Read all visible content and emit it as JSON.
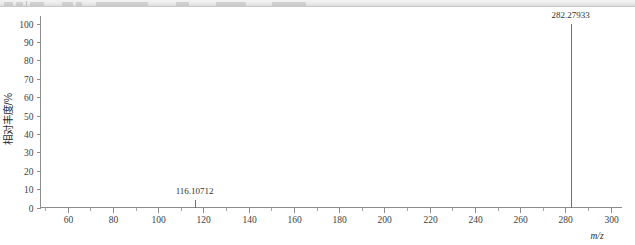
{
  "toolbar": {
    "visible_sliver": true,
    "ghost_labels": [
      "",
      "",
      "",
      "",
      "",
      "",
      ""
    ]
  },
  "chart_data": {
    "type": "bar",
    "title": "",
    "subtitle": "",
    "xlabel": "m/z",
    "ylabel": "相对丰度/%",
    "xlim": [
      48,
      305
    ],
    "ylim": [
      0,
      100
    ],
    "grid": false,
    "legend": null,
    "x_ticks": [
      60,
      80,
      100,
      120,
      140,
      160,
      180,
      200,
      220,
      240,
      260,
      280,
      300
    ],
    "x_tick_labels": [
      "60",
      "80",
      "100",
      "120",
      "140",
      "160",
      "180",
      "200",
      "220",
      "240",
      "260",
      "280",
      "300"
    ],
    "x_minor_tick_step": 10,
    "y_ticks": [
      0,
      10,
      20,
      30,
      40,
      50,
      60,
      70,
      80,
      90,
      100
    ],
    "y_tick_labels": [
      "0",
      "10",
      "20",
      "30",
      "40",
      "50",
      "60",
      "70",
      "80",
      "90",
      "100"
    ],
    "x": [
      116.10712,
      282.27933
    ],
    "values": [
      4,
      100
    ],
    "annotations": [
      {
        "x": 116.10712,
        "y": 4,
        "text": "116.10712"
      },
      {
        "x": 282.27933,
        "y": 100,
        "text": "282.27933"
      }
    ],
    "peak_color": "#6f6f6f",
    "axis_color": "#8c8c8c",
    "background_color": "#ffffff"
  }
}
